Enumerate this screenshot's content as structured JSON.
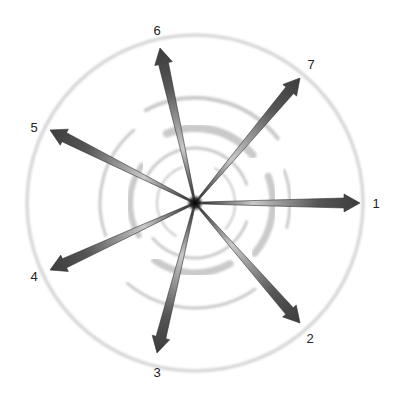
{
  "diagram": {
    "title": "",
    "center": {
      "x": 195,
      "y": 203
    },
    "outer_circle_radius": 168,
    "colors": {
      "circle": "#d8d8d8",
      "arc": "#bdbdbd",
      "arrow_dark": "#3c3c3c",
      "arrow_light": "#c8c8c8",
      "hub": "#111111",
      "label": "#222222"
    },
    "arrows": [
      {
        "label": "1",
        "tip": {
          "x": 360,
          "y": 203
        },
        "label_pos": {
          "x": 376,
          "y": 203
        }
      },
      {
        "label": "2",
        "tip": {
          "x": 300,
          "y": 323
        },
        "label_pos": {
          "x": 310,
          "y": 338
        }
      },
      {
        "label": "3",
        "tip": {
          "x": 157,
          "y": 353
        },
        "label_pos": {
          "x": 157,
          "y": 372
        }
      },
      {
        "label": "4",
        "tip": {
          "x": 50,
          "y": 270
        },
        "label_pos": {
          "x": 34,
          "y": 276
        }
      },
      {
        "label": "5",
        "tip": {
          "x": 50,
          "y": 130
        },
        "label_pos": {
          "x": 34,
          "y": 127
        }
      },
      {
        "label": "6",
        "tip": {
          "x": 160,
          "y": 48
        },
        "label_pos": {
          "x": 157,
          "y": 30
        }
      },
      {
        "label": "7",
        "tip": {
          "x": 300,
          "y": 78
        },
        "label_pos": {
          "x": 311,
          "y": 64
        }
      }
    ]
  }
}
